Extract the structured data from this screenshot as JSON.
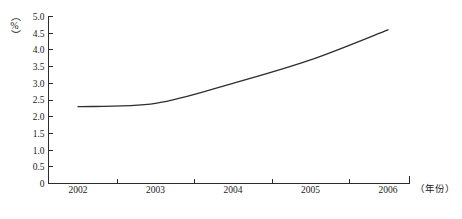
{
  "chart_data": {
    "type": "line",
    "title": "",
    "xlabel": "（年份）",
    "ylabel": "（%）",
    "categories": [
      "2002",
      "2003",
      "2004",
      "2005",
      "2006"
    ],
    "x": [
      2002,
      2003,
      2004,
      2005,
      2006
    ],
    "values": [
      2.3,
      2.4,
      3.0,
      3.7,
      4.6
    ],
    "series": [
      {
        "name": "",
        "values": [
          2.3,
          2.4,
          3.0,
          3.7,
          4.6
        ]
      }
    ],
    "ylim": [
      0,
      5.0
    ],
    "ytick_labels": [
      "0",
      "0.5",
      "1.0",
      "1.5",
      "2.0",
      "2.5",
      "3.0",
      "3.5",
      "4.0",
      "4.5",
      "5.0"
    ],
    "ytick_values": [
      0,
      0.5,
      1.0,
      1.5,
      2.0,
      2.5,
      3.0,
      3.5,
      4.0,
      4.5,
      5.0
    ],
    "xtick_labels": [
      "2002",
      "2003",
      "2004",
      "2005",
      "2006"
    ],
    "grid": false,
    "legend": false,
    "legend_position": "none",
    "line_color": "#2e2e2e",
    "axis_color": "#2b2b2b",
    "background_color": "#ffffff",
    "annotations": []
  },
  "axis": {
    "y_caption": "（%）",
    "x_caption": "（年份）"
  }
}
